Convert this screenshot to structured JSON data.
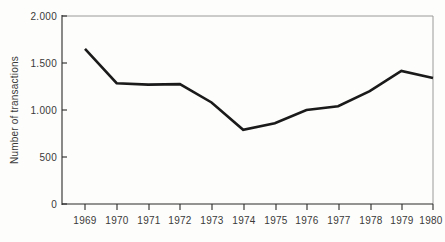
{
  "chart_data": {
    "type": "line",
    "title": "",
    "xlabel": "",
    "ylabel": "Number of transactions",
    "categories": [
      "1969",
      "1970",
      "1971",
      "1972",
      "1973",
      "1974",
      "1975",
      "1976",
      "1977",
      "1978",
      "1979",
      "1980"
    ],
    "x": [
      1969,
      1970,
      1971,
      1972,
      1973,
      1974,
      1975,
      1976,
      1977,
      1978,
      1979,
      1980
    ],
    "values": [
      1650,
      1285,
      1270,
      1275,
      1080,
      790,
      860,
      1000,
      1040,
      1200,
      1415,
      1340
    ],
    "series": [
      {
        "name": "Number of transactions",
        "values": [
          1650,
          1285,
          1270,
          1275,
          1080,
          790,
          860,
          1000,
          1040,
          1200,
          1415,
          1340
        ]
      }
    ],
    "ylim": [
      0,
      2000
    ],
    "xlim": [
      1969,
      1980
    ],
    "yticks": [
      0,
      500,
      1000,
      1500,
      2000
    ],
    "ytick_labels": [
      "0",
      "500",
      "1.000",
      "1.500",
      "2.000"
    ],
    "xtick_labels": [
      "1969",
      "1970",
      "1971",
      "1972",
      "1973",
      "1974",
      "1975",
      "1976",
      "1977",
      "1978",
      "1979",
      "1980"
    ],
    "grid": false,
    "legend": false,
    "legend_position": "none",
    "line_color": "#1a1a1a",
    "axis_color": "#2b2b2b",
    "background_color": "#fdfdfb"
  }
}
